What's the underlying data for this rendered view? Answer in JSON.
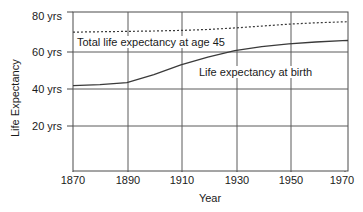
{
  "chart_data": {
    "type": "line",
    "title": "",
    "xlabel": "Year",
    "ylabel": "Life Expectancy",
    "xlim": [
      1870,
      1972
    ],
    "ylim": [
      8,
      80
    ],
    "xticks": [
      1870,
      1890,
      1910,
      1930,
      1950,
      1970
    ],
    "xticklabels": [
      "1870",
      "1890",
      "1910",
      "1930",
      "1950",
      "1970"
    ],
    "yticks": [
      20,
      40,
      60,
      80
    ],
    "yticklabels": [
      "20 yrs",
      "40 yrs",
      "60 yrs",
      "80 yrs"
    ],
    "grid": true,
    "legend_position": "inline-annotations",
    "series": [
      {
        "name": "Total life expectancy at age 45",
        "style": "dotted",
        "color": "#3a3a3a",
        "x": [
          1870,
          1880,
          1890,
          1900,
          1910,
          1920,
          1930,
          1940,
          1950,
          1960,
          1970,
          1972
        ],
        "values": [
          69.4,
          69.6,
          69.8,
          70.0,
          70.3,
          70.8,
          71.6,
          72.6,
          73.6,
          74.3,
          74.8,
          74.9
        ]
      },
      {
        "name": "Life expectancy at birth",
        "style": "solid",
        "color": "#3a3a3a",
        "x": [
          1870,
          1880,
          1890,
          1900,
          1910,
          1920,
          1930,
          1940,
          1950,
          1960,
          1970,
          1972
        ],
        "values": [
          41.2,
          41.8,
          42.8,
          47.0,
          52.2,
          56.3,
          59.7,
          61.8,
          63.2,
          64.2,
          64.9,
          65.0
        ]
      }
    ],
    "annotations": [
      {
        "text": "Total life expectancy at age 45",
        "x": 1874,
        "y": 66.5
      },
      {
        "text": "Life expectancy at birth",
        "x": 1926,
        "y": 53.0
      }
    ]
  },
  "axis": {
    "y_labels": [
      "80 yrs",
      "60 yrs",
      "40 yrs",
      "20 yrs"
    ],
    "x_labels": [
      "1870",
      "1890",
      "1910",
      "1930",
      "1950",
      "1970"
    ],
    "x_title": "Year",
    "y_title": "Life Expectancy"
  },
  "labels": {
    "series_top": "Total life expectancy at age 45",
    "series_bottom": "Life expectancy at birth"
  },
  "colors": {
    "line": "#3a3a3a",
    "grid": "#5a5a5a",
    "frame": "#4a4a4a",
    "background": "#ffffff",
    "text": "#1a1a1a"
  }
}
